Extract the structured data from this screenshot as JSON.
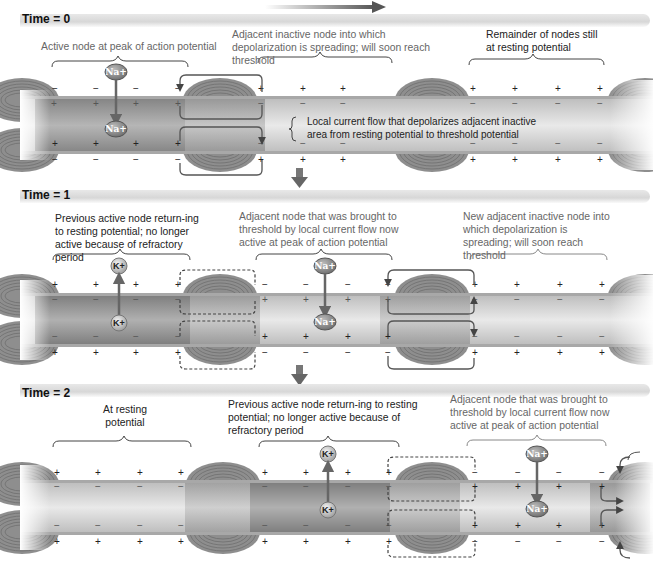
{
  "figure": {
    "direction_arrow": "right-arrow-icon",
    "colors": {
      "axon_dark": "#7a7a7a",
      "axon_light": "#e6e6e6",
      "myelin": "#9a9a9a",
      "text": "#222222",
      "text_light": "#666666"
    }
  },
  "panels": [
    {
      "time_label": "Time = 0",
      "captions": [
        {
          "text": "Active node at peak of action potential"
        },
        {
          "text": "Adjacent inactive node into which depolarization is spreading; will soon reach threshold"
        },
        {
          "text": "Remainder of nodes still at resting potential"
        }
      ],
      "current_label": "Local current flow that depolarizes adjacent inactive area from resting potential to threshold potential",
      "ions": [
        {
          "label": "Na+",
          "position": "outside"
        },
        {
          "label": "Na+",
          "position": "inside"
        }
      ]
    },
    {
      "time_label": "Time = 1",
      "captions": [
        {
          "text": "Previous active node return-ing to resting potential; no longer active because of refractory period"
        },
        {
          "text": "Adjacent node that was brought to threshold by local current flow now active at peak of action potential"
        },
        {
          "text": "New adjacent inactive node into which depolarization is spreading; will soon reach threshold"
        }
      ],
      "ions": [
        {
          "label": "K+",
          "position": "outside"
        },
        {
          "label": "K+",
          "position": "inside"
        },
        {
          "label": "Na+",
          "position": "outside"
        },
        {
          "label": "Na+",
          "position": "inside"
        }
      ]
    },
    {
      "time_label": "Time = 2",
      "captions": [
        {
          "text": "At resting potential"
        },
        {
          "text": "Previous active node return-ing to resting potential; no longer active because of refractory period"
        },
        {
          "text": "Adjacent node that was brought to threshold by local current flow now active at peak of action potential"
        }
      ],
      "ions": [
        {
          "label": "K+",
          "position": "outside"
        },
        {
          "label": "K+",
          "position": "inside"
        },
        {
          "label": "Na+",
          "position": "outside"
        },
        {
          "label": "Na+",
          "position": "inside"
        }
      ]
    }
  ],
  "signs": {
    "plus": "+",
    "minus": "−"
  }
}
